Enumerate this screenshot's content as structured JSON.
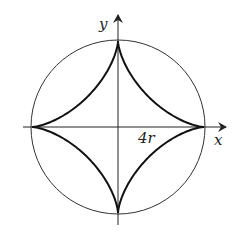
{
  "diagram": {
    "type": "astroid-in-circle",
    "labels": {
      "y_axis": "y",
      "x_axis": "x",
      "radius_label": "4r"
    },
    "colors": {
      "stroke": "#222222",
      "background": "#ffffff"
    },
    "geometry": {
      "center": [
        118,
        127
      ],
      "circle_radius": 87,
      "astroid_radius": 86
    }
  }
}
